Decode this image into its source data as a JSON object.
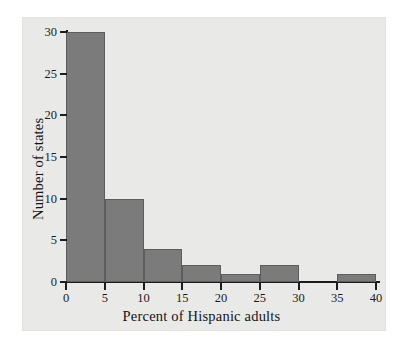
{
  "chart_data": {
    "type": "bar",
    "title": "",
    "xlabel": "Percent of Hispanic adults",
    "ylabel": "Number of states",
    "bin_width": 5,
    "categories": [
      "0-5",
      "5-10",
      "10-15",
      "15-20",
      "20-25",
      "25-30",
      "30-35",
      "35-40"
    ],
    "bin_starts": [
      0,
      5,
      10,
      15,
      20,
      25,
      30,
      35
    ],
    "values": [
      30,
      10,
      4,
      2,
      1,
      2,
      0,
      1
    ],
    "xlim": [
      0,
      40
    ],
    "ylim": [
      0,
      30
    ],
    "xticks": [
      "0",
      "5",
      "10",
      "15",
      "20",
      "25",
      "30",
      "35",
      "40"
    ],
    "xtick_values": [
      0,
      5,
      10,
      15,
      20,
      25,
      30,
      35,
      40
    ],
    "yticks": [
      "0",
      "5",
      "10",
      "15",
      "20",
      "25",
      "30"
    ],
    "ytick_values": [
      0,
      5,
      10,
      15,
      20,
      25,
      30
    ],
    "grid": false,
    "legend": "none",
    "bar_color": "#7b7b7b",
    "bar_edge_color": "#5d5d5d",
    "axis_color": "#1c1c1c",
    "panel_color": "#e9e9e7",
    "page_color": "#ffffff"
  }
}
